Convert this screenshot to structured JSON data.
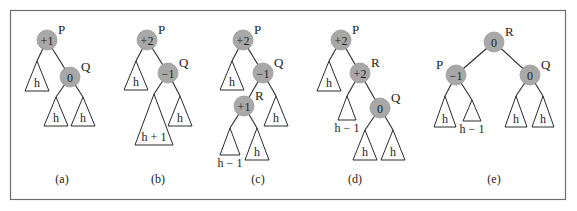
{
  "figure": {
    "panels": [
      {
        "caption": "(a)",
        "nodes": [
          {
            "id": "P",
            "balance": "+1",
            "x": 47,
            "y": 40
          },
          {
            "id": "Q",
            "balance": "0",
            "x": 70,
            "y": 77
          }
        ],
        "edges": [
          [
            "P",
            "Q"
          ]
        ],
        "subtrees": [
          {
            "parent": "P",
            "height_label": "h",
            "apex": [
              37,
              61
            ],
            "base_y": 91,
            "half_w": 12
          },
          {
            "parent": "Q",
            "height_label": "h",
            "apex": [
              56,
              97
            ],
            "base_y": 126,
            "half_w": 12
          },
          {
            "parent": "Q",
            "height_label": "h",
            "apex": [
              83,
              97
            ],
            "base_y": 126,
            "half_w": 12
          }
        ]
      },
      {
        "caption": "(b)",
        "nodes": [
          {
            "id": "P",
            "balance": "+2",
            "x": 147,
            "y": 40
          },
          {
            "id": "Q",
            "balance": "−1",
            "x": 168,
            "y": 73
          }
        ],
        "edges": [
          [
            "P",
            "Q"
          ]
        ],
        "subtrees": [
          {
            "parent": "P",
            "height_label": "h",
            "apex": [
              136,
              61
            ],
            "base_y": 90,
            "half_w": 12
          },
          {
            "parent": "Q",
            "height_label": "h + 1",
            "apex": [
              154,
              94
            ],
            "base_y": 145,
            "half_w": 19
          },
          {
            "parent": "Q",
            "height_label": "h",
            "apex": [
              180,
              96
            ],
            "base_y": 126,
            "half_w": 12
          }
        ]
      },
      {
        "caption": "(c)",
        "nodes": [
          {
            "id": "P",
            "balance": "+2",
            "x": 243,
            "y": 40
          },
          {
            "id": "Q",
            "balance": "−1",
            "x": 263,
            "y": 73
          },
          {
            "id": "R",
            "balance": "+1",
            "x": 244,
            "y": 106
          }
        ],
        "edges": [
          [
            "P",
            "Q"
          ],
          [
            "Q",
            "R"
          ]
        ],
        "subtrees": [
          {
            "parent": "P",
            "height_label": "h",
            "apex": [
              232,
              61
            ],
            "base_y": 90,
            "half_w": 12
          },
          {
            "parent": "Q",
            "height_label": "h",
            "apex": [
              276,
              96
            ],
            "base_y": 126,
            "half_w": 12
          },
          {
            "parent": "R",
            "height_label": "h − 1",
            "apex": [
              230,
              128
            ],
            "base_y": 155,
            "half_w": 10,
            "label_below": true
          },
          {
            "parent": "R",
            "height_label": "h",
            "apex": [
              257,
              128
            ],
            "base_y": 160,
            "half_w": 12
          }
        ]
      },
      {
        "caption": "(d)",
        "nodes": [
          {
            "id": "P",
            "balance": "+2",
            "x": 341,
            "y": 40
          },
          {
            "id": "R",
            "balance": "+2",
            "x": 360,
            "y": 73
          },
          {
            "id": "Q",
            "balance": "0",
            "x": 380,
            "y": 108
          }
        ],
        "edges": [
          [
            "P",
            "R"
          ],
          [
            "R",
            "Q"
          ]
        ],
        "subtrees": [
          {
            "parent": "P",
            "height_label": "h",
            "apex": [
              329,
              61
            ],
            "base_y": 91,
            "half_w": 12
          },
          {
            "parent": "R",
            "height_label": "h − 1",
            "apex": [
              347,
              96
            ],
            "base_y": 120,
            "half_w": 9,
            "label_below": true
          },
          {
            "parent": "Q",
            "height_label": "h",
            "apex": [
              365,
              130
            ],
            "base_y": 160,
            "half_w": 12
          },
          {
            "parent": "Q",
            "height_label": "h",
            "apex": [
              393,
              130
            ],
            "base_y": 160,
            "half_w": 12
          }
        ]
      },
      {
        "caption": "(e)",
        "nodes": [
          {
            "id": "R",
            "balance": "0",
            "x": 494,
            "y": 42
          },
          {
            "id": "P",
            "balance": "−1",
            "x": 456,
            "y": 75
          },
          {
            "id": "Q",
            "balance": "0",
            "x": 530,
            "y": 75
          }
        ],
        "edges": [
          [
            "R",
            "P"
          ],
          [
            "R",
            "Q"
          ]
        ],
        "subtrees": [
          {
            "parent": "P",
            "height_label": "h",
            "apex": [
              445,
              96
            ],
            "base_y": 127,
            "half_w": 11
          },
          {
            "parent": "P",
            "height_label": "h − 1",
            "apex": [
              472,
              100
            ],
            "base_y": 121,
            "half_w": 9,
            "label_below": true
          },
          {
            "parent": "Q",
            "height_label": "h",
            "apex": [
              516,
              96
            ],
            "base_y": 127,
            "half_w": 11
          },
          {
            "parent": "Q",
            "height_label": "h",
            "apex": [
              543,
              96
            ],
            "base_y": 127,
            "half_w": 11
          }
        ]
      }
    ],
    "caption_y": 183
  }
}
